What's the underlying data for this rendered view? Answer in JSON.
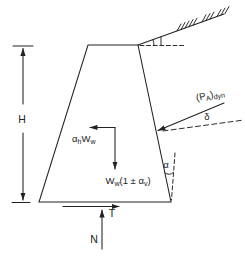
{
  "labels": {
    "height": "H",
    "horizontal_inertia_parts": [
      {
        "t": "α"
      },
      {
        "t": "h",
        "sub": true
      },
      {
        "t": "W"
      },
      {
        "t": "w",
        "sub": true
      }
    ],
    "vertical_weight_parts": [
      {
        "t": "W"
      },
      {
        "t": "w",
        "sub": true
      },
      {
        "t": "(1 ± "
      },
      {
        "t": "α"
      },
      {
        "t": "v",
        "sub": true
      },
      {
        "t": ")"
      }
    ],
    "dynamic_thrust_parts": [
      {
        "t": "(P"
      },
      {
        "t": "A",
        "sub": true
      },
      {
        "t": ")"
      },
      {
        "t": "dyn",
        "sub": true
      }
    ],
    "wall_friction_angle": "δ",
    "wall_inclination_angle": "α",
    "base_shear": "T",
    "base_normal": "N"
  },
  "colors": {
    "ink": "#222222",
    "background": "#ffffff"
  }
}
